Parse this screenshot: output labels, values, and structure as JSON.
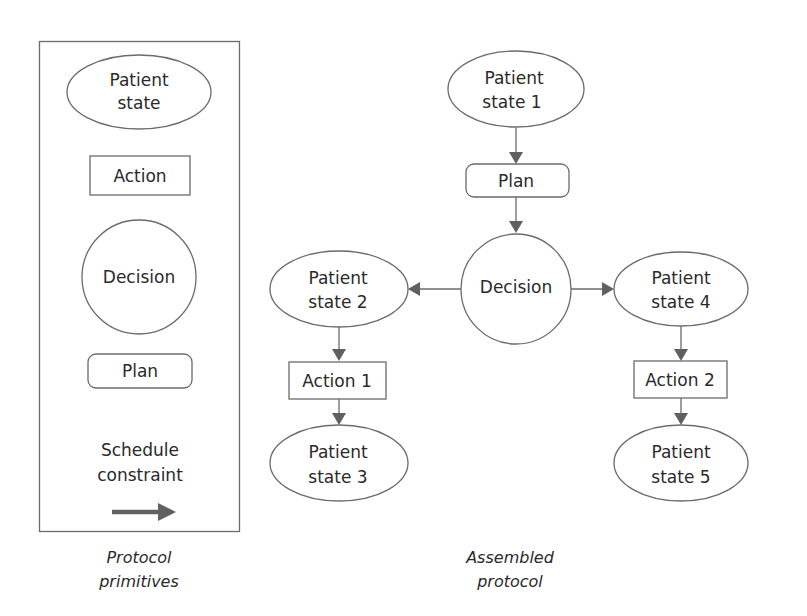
{
  "primitives_panel": {
    "caption_line1": "Protocol",
    "caption_line2": "primitives",
    "patient_state": {
      "line1": "Patient",
      "line2": "state"
    },
    "action": "Action",
    "decision": "Decision",
    "plan": "Plan",
    "schedule_constraint": {
      "line1": "Schedule",
      "line2": "constraint"
    }
  },
  "assembled_protocol": {
    "caption_line1": "Assembled",
    "caption_line2": "protocol",
    "nodes": {
      "patient_state_1": {
        "line1": "Patient",
        "line2": "state 1"
      },
      "plan": "Plan",
      "decision": "Decision",
      "patient_state_2": {
        "line1": "Patient",
        "line2": "state 2"
      },
      "patient_state_4": {
        "line1": "Patient",
        "line2": "state 4"
      },
      "action_1": "Action 1",
      "action_2": "Action 2",
      "patient_state_3": {
        "line1": "Patient",
        "line2": "state 3"
      },
      "patient_state_5": {
        "line1": "Patient",
        "line2": "state 5"
      }
    },
    "edges": [
      {
        "from": "Patient state 1",
        "to": "Plan"
      },
      {
        "from": "Plan",
        "to": "Decision"
      },
      {
        "from": "Decision",
        "to": "Patient state 2"
      },
      {
        "from": "Decision",
        "to": "Patient state 4"
      },
      {
        "from": "Patient state 2",
        "to": "Action 1"
      },
      {
        "from": "Action 1",
        "to": "Patient state 3"
      },
      {
        "from": "Patient state 4",
        "to": "Action 2"
      },
      {
        "from": "Action 2",
        "to": "Patient state 5"
      }
    ]
  },
  "colors": {
    "stroke": "#6b6b6b",
    "text": "#2a2a2a",
    "arrow": "#606060"
  }
}
